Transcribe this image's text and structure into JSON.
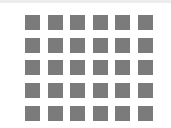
{
  "grid": {
    "rows": 5,
    "columns": 6,
    "cell_color": "#7b7b7b",
    "background_color": "#ffffff",
    "top_band_color": "#ededed"
  }
}
